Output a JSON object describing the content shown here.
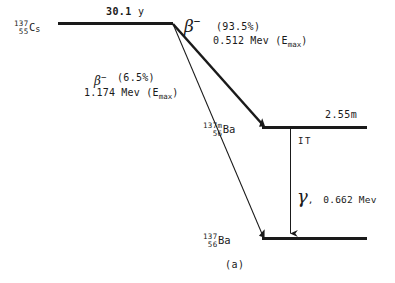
{
  "figure": {
    "caption": "(a)",
    "background_color": "#ffffff",
    "ink_color": "#1a1a1a"
  },
  "parent": {
    "nuclide": {
      "mass_number": "137",
      "atomic_number": "55",
      "symbol": "C",
      "symbol_tail": "s",
      "full": "137-55-Cs"
    },
    "half_life": "30.1 y",
    "half_life_value": "30.1",
    "half_life_unit": "y"
  },
  "branches": [
    {
      "id": "beta-major",
      "particle": "β",
      "charge": "−",
      "intensity": "(93.5%)",
      "intensity_value": 93.5,
      "energy": "0.512 Mev",
      "energy_value": 0.512,
      "energy_unit": "Mev",
      "energy_qualifier": "(E",
      "energy_qualifier_sub": "max",
      "energy_qualifier_close": ")",
      "to": "Ba-137m"
    },
    {
      "id": "beta-minor",
      "particle": "β",
      "charge": "−",
      "intensity": "(6.5%)",
      "intensity_value": 6.5,
      "energy": "1.174 Mev",
      "energy_value": 1.174,
      "energy_unit": "Mev",
      "energy_qualifier": "(E",
      "energy_qualifier_sub": "max",
      "energy_qualifier_close": ")",
      "to": "Ba-137"
    }
  ],
  "levels": [
    {
      "id": "ba137m",
      "nuclide": {
        "mass_number": "137m",
        "atomic_number": "56",
        "symbol": "Ba",
        "symbol_tail": "",
        "full": "137m-56-Ba"
      },
      "half_life": "2.55m"
    },
    {
      "id": "ba137",
      "nuclide": {
        "mass_number": "137",
        "atomic_number": "56",
        "symbol": "Ba",
        "symbol_tail": "",
        "full": "137-56-Ba"
      },
      "half_life": ""
    }
  ],
  "transition": {
    "id": "isomeric-transition",
    "mode_label": "IT",
    "particle": "γ",
    "separator": ",",
    "energy": "0.662 Mev",
    "energy_value": 0.662,
    "energy_unit": "Mev"
  }
}
